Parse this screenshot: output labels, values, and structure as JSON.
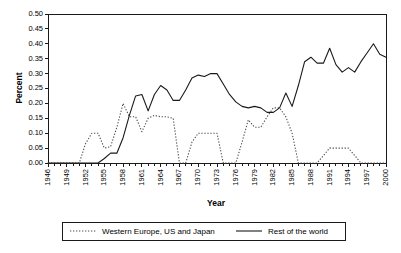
{
  "chart_data": {
    "type": "line",
    "title": "",
    "xlabel": "Year",
    "ylabel": "Percent",
    "ylim": [
      0.0,
      0.5
    ],
    "xlim": [
      1946,
      2000
    ],
    "grid": false,
    "legend_position": "bottom",
    "ytick_labels": [
      "0.00",
      "0.05",
      "0.10",
      "0.15",
      "0.20",
      "0.25",
      "0.30",
      "0.35",
      "0.40",
      "0.45",
      "0.50"
    ],
    "ytick_values": [
      0.0,
      0.05,
      0.1,
      0.15,
      0.2,
      0.25,
      0.3,
      0.35,
      0.4,
      0.45,
      0.5
    ],
    "xtick_labels": [
      "1946",
      "1949",
      "1952",
      "1955",
      "1958",
      "1961",
      "1964",
      "1967",
      "1970",
      "1973",
      "1976",
      "1979",
      "1982",
      "1985",
      "1988",
      "1991",
      "1994",
      "1997",
      "2000"
    ],
    "xtick_values": [
      1946,
      1949,
      1952,
      1955,
      1958,
      1961,
      1964,
      1967,
      1970,
      1973,
      1976,
      1979,
      1982,
      1985,
      1988,
      1991,
      1994,
      1997,
      2000
    ],
    "x": [
      1946,
      1947,
      1948,
      1949,
      1950,
      1951,
      1952,
      1953,
      1954,
      1955,
      1956,
      1957,
      1958,
      1959,
      1960,
      1961,
      1962,
      1963,
      1964,
      1965,
      1966,
      1967,
      1968,
      1969,
      1970,
      1971,
      1972,
      1973,
      1974,
      1975,
      1976,
      1977,
      1978,
      1979,
      1980,
      1981,
      1982,
      1983,
      1984,
      1985,
      1986,
      1987,
      1988,
      1989,
      1990,
      1991,
      1992,
      1993,
      1994,
      1995,
      1996,
      1997,
      1998,
      1999,
      2000
    ],
    "series": [
      {
        "name": "Western Europe, US and Japan",
        "style": "dotted",
        "color": "#4d4d4d",
        "values": [
          0.0,
          0.0,
          0.0,
          0.0,
          0.0,
          0.0,
          0.065,
          0.1,
          0.1,
          0.05,
          0.055,
          0.12,
          0.2,
          0.155,
          0.155,
          0.105,
          0.15,
          0.16,
          0.155,
          0.155,
          0.15,
          0.0,
          0.0,
          0.07,
          0.1,
          0.1,
          0.1,
          0.1,
          0.0,
          0.0,
          0.0,
          0.07,
          0.145,
          0.12,
          0.12,
          0.155,
          0.185,
          0.185,
          0.155,
          0.1,
          0.0,
          0.0,
          0.0,
          0.0,
          0.025,
          0.05,
          0.05,
          0.05,
          0.05,
          0.025,
          0.0,
          0.0,
          0.0,
          0.0,
          0.0
        ]
      },
      {
        "name": "Rest of the world",
        "style": "solid",
        "color": "#1a1a1a",
        "values": [
          0.0,
          0.0,
          0.0,
          0.0,
          0.0,
          0.0,
          0.0,
          0.0,
          0.0,
          0.015,
          0.033,
          0.033,
          0.085,
          0.16,
          0.225,
          0.23,
          0.175,
          0.23,
          0.26,
          0.245,
          0.21,
          0.21,
          0.245,
          0.285,
          0.295,
          0.29,
          0.3,
          0.3,
          0.265,
          0.23,
          0.205,
          0.19,
          0.185,
          0.19,
          0.185,
          0.17,
          0.17,
          0.185,
          0.235,
          0.19,
          0.26,
          0.34,
          0.355,
          0.335,
          0.335,
          0.385,
          0.33,
          0.305,
          0.32,
          0.305,
          0.34,
          0.37,
          0.4,
          0.365,
          0.355
        ]
      }
    ],
    "series_continued": [
      {
        "name": "Rest of the world (1990-2000 detail)",
        "x": [
          1989,
          1990,
          1991,
          1992,
          1993,
          1994,
          1995,
          1996,
          1997,
          1998,
          1999,
          2000
        ],
        "values": [
          0.335,
          0.335,
          0.385,
          0.33,
          0.305,
          0.32,
          0.305,
          0.34,
          0.37,
          0.4,
          0.365,
          0.355
        ]
      }
    ]
  },
  "legend": {
    "entries": [
      {
        "label": "Western Europe, US and Japan",
        "style": "dotted"
      },
      {
        "label": "Rest of the world",
        "style": "solid"
      }
    ]
  },
  "axes": {
    "x_title": "Year",
    "y_title": "Percent"
  }
}
